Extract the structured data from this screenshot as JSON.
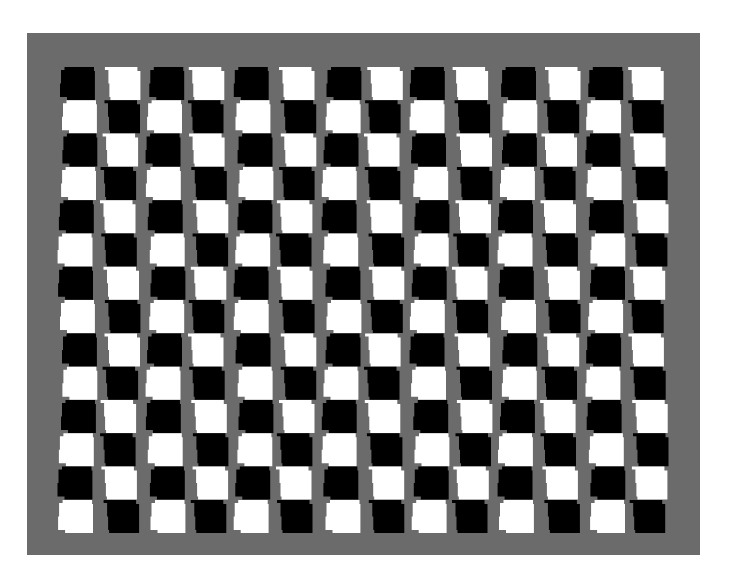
{
  "image": {
    "description": "Distorted checkerboard optical illusion on gray background",
    "width": 731,
    "height": 578,
    "background_color": "#ffffff"
  },
  "panel": {
    "x": 27,
    "y": 33,
    "width": 673,
    "height": 522,
    "color": "#6b6b6b"
  },
  "grid": {
    "columns": 14,
    "rows": 14,
    "origin_x": 60,
    "origin_y": 67,
    "col_pitch": 44.0,
    "row_pitch": 33.3,
    "cell_width": 34,
    "cell_height": 33,
    "first_cell_color": "black",
    "colors": {
      "black": "#000000",
      "white": "#ffffff"
    },
    "step_offset": 3,
    "wave_amplitude": 2.5
  }
}
